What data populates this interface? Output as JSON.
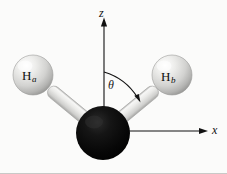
{
  "figure": {
    "type": "molecular-geometry-diagram",
    "background_color": "#fbfbfa",
    "border_color": "#c9c9c7"
  },
  "axes": {
    "vertical": {
      "name": "z-axis",
      "label": "z",
      "direction": "up",
      "line_color": "#111111",
      "origin_px": [
        104,
        131
      ],
      "tip_px": [
        104,
        19
      ]
    },
    "horizontal": {
      "name": "x-axis",
      "label": "x",
      "direction": "right",
      "line_color": "#111111",
      "origin_px": [
        104,
        131
      ],
      "tip_px": [
        207,
        131
      ]
    }
  },
  "angle": {
    "name": "bond-angle",
    "symbol": "θ",
    "measured_from": "z",
    "arc_start_px": [
      104,
      72
    ],
    "arc_end_px": [
      139,
      100
    ],
    "arrow_direction": "clockwise"
  },
  "atoms": [
    {
      "id": "central-atom",
      "label": "",
      "color": "#0a0a0a",
      "highlight_color": "#3a3a3a",
      "center_px": [
        103,
        133
      ],
      "radius_px": 27
    },
    {
      "id": "hydrogen-a",
      "label": "H",
      "subscript": "a",
      "color": "#d8d8d6",
      "highlight_color": "#fdfdfd",
      "center_px": [
        33,
        75
      ],
      "radius_px": 20
    },
    {
      "id": "hydrogen-b",
      "label": "H",
      "subscript": "b",
      "color": "#d8d8d6",
      "highlight_color": "#fdfdfd",
      "center_px": [
        172,
        75
      ],
      "radius_px": 20
    }
  ],
  "bonds": [
    {
      "id": "bond-a",
      "from": "central-atom",
      "to": "hydrogen-a",
      "color": "#e4e4e2",
      "edge_color": "#9f9f9d"
    },
    {
      "id": "bond-b",
      "from": "central-atom",
      "to": "hydrogen-b",
      "color": "#e4e4e2",
      "edge_color": "#9f9f9d"
    }
  ],
  "labels": {
    "z": "z",
    "x": "x",
    "theta": "θ",
    "h_a_base": "H",
    "h_a_sub": "a",
    "h_b_base": "H",
    "h_b_sub": "b"
  }
}
